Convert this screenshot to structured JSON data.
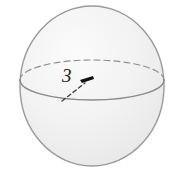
{
  "figure": {
    "kind": "sphere-diagram",
    "background_color": "#ffffff",
    "sphere": {
      "name": "sphere",
      "center_x": 92,
      "center_y": 86,
      "radius_x": 72,
      "radius_y": 80,
      "fill_color": "#f1f1f1",
      "fill_highlight_color": "#fafafa",
      "outline_color": "#9a9a9a",
      "outline_width": 1.4
    },
    "equator": {
      "name": "equator-ellipse",
      "center_x": 92,
      "center_y": 80,
      "radius_x": 72,
      "radius_y": 20,
      "back_arc_style": "dashed",
      "front_arc_style": "solid",
      "stroke_color": "#8f8f8f",
      "dash_pattern": "6 4"
    },
    "radius_annotation": {
      "name": "radius-measure",
      "label": "3",
      "label_color": "#1a1a1a",
      "leader_line": {
        "style": "dashed",
        "from_x": 62,
        "from_y": 101,
        "to_x": 86,
        "to_y": 82,
        "stroke_color": "#3a3a3a",
        "dash_pattern": "4 3"
      },
      "arrowhead": {
        "name": "arrow-right",
        "x": 85,
        "y": 78,
        "direction": "right",
        "color": "#111111"
      }
    }
  }
}
